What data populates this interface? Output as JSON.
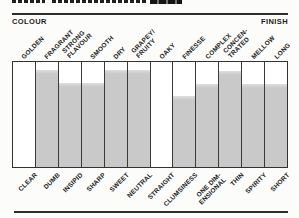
{
  "header": {
    "left_label": "COLOUR",
    "right_label": "FINISH"
  },
  "chart_data": {
    "type": "bar",
    "title": "",
    "subtitle": "Tasting profile chart: 12 bipolar attribute scales, filled from the bottom (negative trait) toward the top (positive trait)",
    "left_header": "COLOUR",
    "right_header": "FINISH",
    "ylim": [
      0,
      10
    ],
    "grid": false,
    "legend": false,
    "colors": {
      "fill": "#c9c9c9",
      "fill_top_edge": "#dedede",
      "line": "#3a3a3a",
      "cell_background": "#ffffff",
      "text": "#1e1e1e"
    },
    "categories": [
      "CLEAR",
      "DUMB",
      "INSIPID",
      "SHARP",
      "SWEET",
      "NEUTRAL",
      "STRAIGHT",
      "CLUMSINESS",
      "ONE DIM-ENSIONAL",
      "THIN",
      "SPIRITY",
      "SHORT"
    ],
    "top_labels": [
      "GOLDEN",
      "FRAGRANT",
      "STRONG FLAVOUR",
      "SMOOTH",
      "DRY",
      "GRAPEY/FRUITY",
      "OAKY",
      "FINESSE",
      "COMPLEX",
      "CONCEN-TRATED",
      "MELLOW",
      "LONG"
    ],
    "values": [
      0,
      9.2,
      8.0,
      8.0,
      9.2,
      9.2,
      0,
      6.8,
      7.9,
      9.1,
      7.9,
      7.9
    ],
    "columns": [
      {
        "bottom": "CLEAR",
        "top": "GOLDEN",
        "value": 0
      },
      {
        "bottom": "DUMB",
        "top": "FRAGRANT",
        "value": 9.2
      },
      {
        "bottom": "INSIPID",
        "top": "STRONG\nFLAVOUR",
        "value": 8.0
      },
      {
        "bottom": "SHARP",
        "top": "SMOOTH",
        "value": 8.0
      },
      {
        "bottom": "SWEET",
        "top": "DRY",
        "value": 9.2
      },
      {
        "bottom": "NEUTRAL",
        "top": "GRAPEY/\nFRUITY",
        "value": 9.2
      },
      {
        "bottom": "STRAIGHT",
        "top": "OAKY",
        "value": 0
      },
      {
        "bottom": "CLUMSINESS",
        "top": "FINESSE",
        "value": 6.8
      },
      {
        "bottom": "ONE DIM-\nENSIONAL",
        "top": "COMPLEX",
        "value": 7.9
      },
      {
        "bottom": "THIN",
        "top": "CONCEN-\nTRATED",
        "value": 9.1
      },
      {
        "bottom": "SPIRITY",
        "top": "MELLOW",
        "value": 7.9
      },
      {
        "bottom": "SHORT",
        "top": "LONG",
        "value": 7.9
      }
    ]
  }
}
